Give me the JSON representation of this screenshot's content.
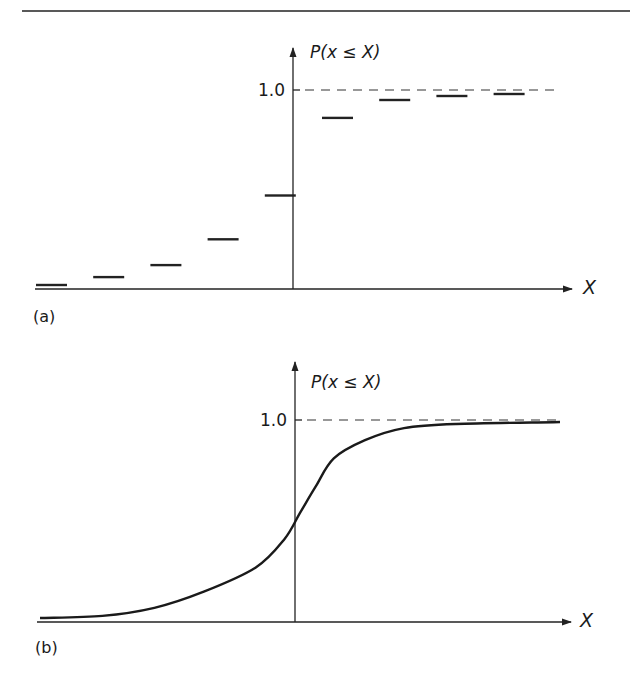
{
  "chart_data": [
    {
      "panel_label": "(a)",
      "type": "line",
      "subtype": "step",
      "title": "",
      "xlabel": "X",
      "ylabel": "P(x ≤ X)",
      "yticks": [
        {
          "value": 1.0,
          "label": "1.0"
        }
      ],
      "ylim": [
        0,
        1.0
      ],
      "reference_line": {
        "y": 1.0,
        "style": "dashed"
      },
      "steps": [
        {
          "index": 1,
          "value": 0.02
        },
        {
          "index": 2,
          "value": 0.06
        },
        {
          "index": 3,
          "value": 0.12
        },
        {
          "index": 4,
          "value": 0.25
        },
        {
          "index": 5,
          "value": 0.47
        },
        {
          "index": 6,
          "value": 0.86
        },
        {
          "index": 7,
          "value": 0.95
        },
        {
          "index": 8,
          "value": 0.97
        },
        {
          "index": 9,
          "value": 0.98
        }
      ],
      "grid": false,
      "legend": "none"
    },
    {
      "panel_label": "(b)",
      "type": "line",
      "subtype": "continuous-cdf",
      "title": "",
      "xlabel": "X",
      "ylabel": "P(x ≤ X)",
      "yticks": [
        {
          "value": 1.0,
          "label": "1.0"
        }
      ],
      "ylim": [
        0,
        1.0
      ],
      "xlim": [
        -1.0,
        1.0
      ],
      "reference_line": {
        "y": 1.0,
        "style": "dashed"
      },
      "x": [
        -1.0,
        -0.76,
        -0.56,
        -0.37,
        -0.17,
        -0.06,
        0.0,
        0.06,
        0.13,
        0.25,
        0.4,
        0.6,
        1.0
      ],
      "y": [
        0.02,
        0.03,
        0.07,
        0.15,
        0.27,
        0.41,
        0.54,
        0.67,
        0.81,
        0.9,
        0.96,
        0.98,
        0.99
      ],
      "grid": false,
      "legend": "none"
    }
  ]
}
